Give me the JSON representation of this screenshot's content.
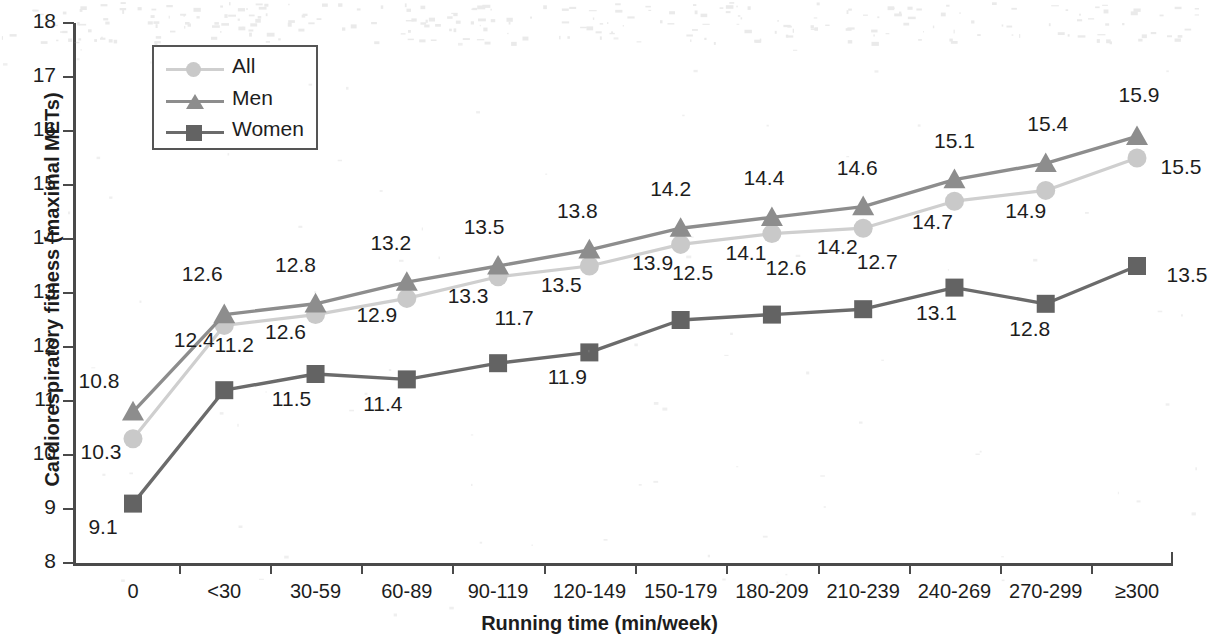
{
  "chart_data": {
    "type": "line",
    "title": "",
    "xlabel": "Running time (min/week)",
    "ylabel": "Cardiorespiratory fitness  (maximal METs)",
    "categories": [
      "0",
      "<30",
      "30-59",
      "60-89",
      "90-119",
      "120-149",
      "150-179",
      "180-209",
      "210-239",
      "240-269",
      "270-299",
      "≥300"
    ],
    "ylim": [
      8,
      18
    ],
    "yticks": [
      "8",
      "9",
      "10",
      "11",
      "12",
      "13",
      "14",
      "15",
      "16",
      "17",
      "18"
    ],
    "grid": false,
    "legend_position": "top-left",
    "series": [
      {
        "name": "All",
        "marker": "circle",
        "color": "#c9c9c9",
        "line_color": "#cfcfcf",
        "label_position": "below",
        "values": [
          10.3,
          12.4,
          12.6,
          12.9,
          13.3,
          13.5,
          13.9,
          14.1,
          14.2,
          14.7,
          14.9,
          15.5
        ]
      },
      {
        "name": "Men",
        "marker": "triangle",
        "color": "#8d8d8d",
        "line_color": "#8d8d8d",
        "label_position": "above",
        "values": [
          10.8,
          12.6,
          12.8,
          13.2,
          13.5,
          13.8,
          14.2,
          14.4,
          14.6,
          15.1,
          15.4,
          15.9
        ]
      },
      {
        "name": "Women",
        "marker": "square",
        "color": "#636363",
        "line_color": "#6b6b6b",
        "label_position": "below",
        "values": [
          9.1,
          11.2,
          11.5,
          11.4,
          11.7,
          11.9,
          12.5,
          12.6,
          12.7,
          13.1,
          12.8,
          13.5
        ]
      }
    ]
  },
  "legend": {
    "items": [
      {
        "label": "All"
      },
      {
        "label": "Men"
      },
      {
        "label": "Women"
      }
    ]
  }
}
